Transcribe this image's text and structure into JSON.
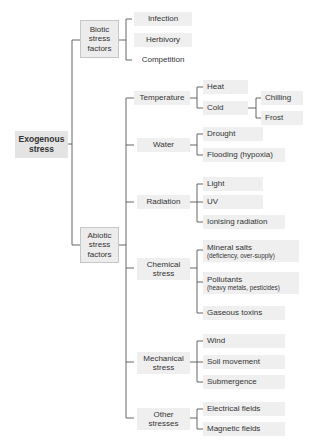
{
  "root": {
    "label_line1": "Exogenous",
    "label_line2": "stress"
  },
  "biotic": {
    "label_line1": "Biotic",
    "label_line2": "stress",
    "label_line3": "factors",
    "items": [
      "Infection",
      "Herbivory",
      "Competition"
    ]
  },
  "abiotic": {
    "label_line1": "Abiotic",
    "label_line2": "stress",
    "label_line3": "factors",
    "categories": [
      {
        "label": "Temperature",
        "items": [
          "Heat",
          "Cold"
        ],
        "cold_items": [
          "Chilling",
          "Frost"
        ]
      },
      {
        "label": "Water",
        "items": [
          "Drought",
          "Flooding (hypoxia)"
        ]
      },
      {
        "label": "Radiation",
        "items": [
          "Light",
          "UV",
          "Ionising radiation"
        ]
      },
      {
        "label_line1": "Chemical",
        "label_line2": "stress",
        "items": [
          {
            "main": "Mineral salts",
            "sub": "(deficiency, over-supply)"
          },
          {
            "main": "Pollutants",
            "sub": "(heavy metals, pesticides)"
          },
          {
            "main": "Gaseous toxins"
          }
        ]
      },
      {
        "label_line1": "Mechanical",
        "label_line2": "stress",
        "items": [
          "Wind",
          "Soil movement",
          "Submergence"
        ]
      },
      {
        "label_line1": "Other",
        "label_line2": "stresses",
        "items": [
          "Electrical fields",
          "Magnetic fields"
        ]
      }
    ]
  },
  "colors": {
    "box_fill": "#efefef",
    "line": "#555555",
    "text": "#333333"
  }
}
